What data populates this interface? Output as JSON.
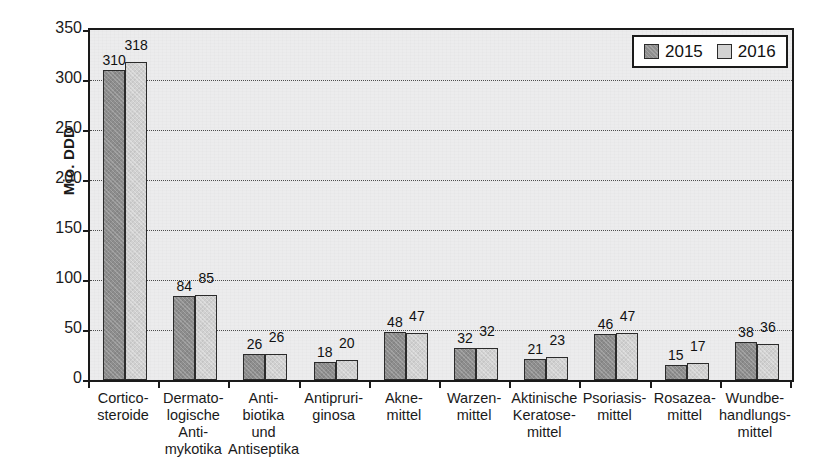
{
  "chart_data": {
    "type": "bar",
    "title": "",
    "subtitle": "",
    "xlabel": "",
    "ylabel": "Mio. DDD",
    "ylim": [
      0,
      350
    ],
    "yticks": [
      0,
      50,
      100,
      150,
      200,
      250,
      300,
      350
    ],
    "grid": "horizontal-dotted",
    "legend_position": "top-right",
    "categories": [
      "Cortico-\nsteroide",
      "Dermato-\nlogische\nAnti-\nmykotika",
      "Anti-\nbiotika\nund\nAntiseptika",
      "Antipruri-\nginosa",
      "Akne-\nmittel",
      "Warzen-\nmittel",
      "Aktinische\nKeratose-\nmittel",
      "Psoriasis-\nmittel",
      "Rosazea-\nmittel",
      "Wundbe-\nhandlungs-\nmittel"
    ],
    "series": [
      {
        "name": "2015",
        "color": "#8e8e8e",
        "values": [
          310,
          84,
          26,
          18,
          48,
          32,
          21,
          46,
          15,
          38
        ]
      },
      {
        "name": "2016",
        "color": "#d2d2d2",
        "values": [
          318,
          85,
          26,
          20,
          47,
          32,
          23,
          47,
          17,
          36
        ]
      }
    ]
  },
  "legend": {
    "items": [
      {
        "label": "2015",
        "swatch": "dark-gray-swatch"
      },
      {
        "label": "2016",
        "swatch": "light-gray-swatch"
      }
    ]
  },
  "axis": {
    "y_title": "Mio. DDD",
    "y_tick_labels": [
      "0",
      "50",
      "100",
      "150",
      "200",
      "250",
      "300",
      "350"
    ]
  }
}
